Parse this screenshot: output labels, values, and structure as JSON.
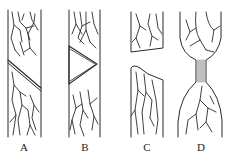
{
  "diagram": {
    "panels": [
      {
        "id": "A",
        "label": "A",
        "description": "Vein network strip crossed by a diagonal band"
      },
      {
        "id": "B",
        "label": "B",
        "description": "Vein network strip with triangular wedge cut-in"
      },
      {
        "id": "C",
        "label": "C",
        "description": "Strip separated into two pieces with a gap"
      },
      {
        "id": "D",
        "label": "D",
        "description": "Two bulbous vein segments joined by a narrow striated neck"
      }
    ],
    "colors": {
      "line": "#2a2a2a",
      "background": "#ffffff"
    }
  }
}
